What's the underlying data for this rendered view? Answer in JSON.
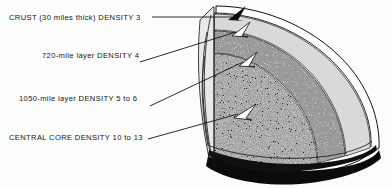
{
  "figure": {
    "background_color": "#fdfdfb",
    "ink_color": "#141414"
  },
  "labels": [
    {
      "id": "crust",
      "text": "CRUST (30 miles thick) DENSITY 3",
      "layer": "crust",
      "density": "3",
      "thickness": "30 miles",
      "leader": "horizontal-right-to-arrowhead"
    },
    {
      "id": "layer720",
      "text": "720-mile layer DENSITY 4",
      "layer": "720-mile layer",
      "density": "4",
      "thickness": "720 miles",
      "leader": "rising-right-to-arrowhead"
    },
    {
      "id": "layer1050",
      "text": "1050-mile layer DENSITY 5 to 6",
      "layer": "1050-mile layer",
      "density": "5 to 6",
      "thickness": "1050 miles",
      "leader": "rising-right-to-arrowhead"
    },
    {
      "id": "core",
      "text": "CENTRAL CORE DENSITY 10 to 13",
      "layer": "CENTRAL CORE",
      "density": "10 to 13",
      "thickness": "",
      "leader": "rising-right-to-arrowhead"
    }
  ],
  "diagram": {
    "shape": "quarter-cut sphere",
    "layer_bands": [
      {
        "name": "crust",
        "shade": "#ffffff",
        "outline": "#101010"
      },
      {
        "name": "720-mile layer",
        "shade": "#d6d6d6"
      },
      {
        "name": "1050-mile layer",
        "shade": "#8f8f8f"
      },
      {
        "name": "central core",
        "shade": "#1c1c1c"
      }
    ],
    "base": {
      "name": "equatorial cut base",
      "shade": "#080808"
    },
    "arrowheads": 4
  }
}
